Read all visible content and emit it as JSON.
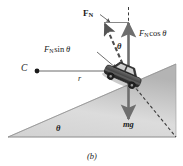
{
  "figure": {
    "caption": "(b)",
    "colors": {
      "stroke": "#3a3a3a",
      "text": "#1a1a1a",
      "incline_light": "#e8e8e8",
      "incline_dark": "#b9b9b9",
      "car_body": "#4a4a4a",
      "arrow": "#6e6e6e"
    }
  },
  "labels": {
    "normal_force": {
      "symbol": "F",
      "subscript": "N"
    },
    "normal_cos": {
      "symbol": "F",
      "subscript": "N",
      "operator": "cos",
      "angle": "θ"
    },
    "normal_sin": {
      "symbol": "F",
      "subscript": "N",
      "operator": "sin",
      "angle": "θ"
    },
    "angle_top": "θ",
    "angle_incline": "θ",
    "center_point": "C",
    "radius": "r",
    "weight": "mg"
  },
  "geometry": {
    "center_dot": {
      "x": 37,
      "y": 71
    },
    "car": {
      "x": 124,
      "y": 73
    },
    "incline_base_left": {
      "x": 8,
      "y": 137
    },
    "incline_base_right": {
      "x": 176,
      "y": 137
    },
    "incline_apex": {
      "x": 176,
      "y": 64
    },
    "radius_line": {
      "x1": 37,
      "y1": 71,
      "x2": 124,
      "y2": 71
    }
  }
}
